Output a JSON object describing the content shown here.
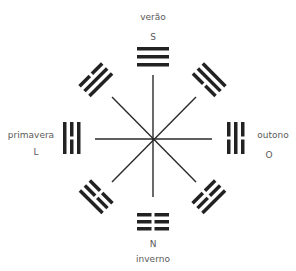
{
  "diagram": {
    "type": "bagua-compass",
    "center": {
      "x": 153,
      "y": 139
    },
    "line_color": "#2a2a2a",
    "trigram_color": "#222222",
    "seasons": {
      "top": {
        "season": "verão",
        "direction": "S",
        "trigram": "qian",
        "lines_outer_to_inner": [
          "solid",
          "solid",
          "solid"
        ]
      },
      "bottom": {
        "season": "inverno",
        "direction": "N",
        "trigram": "kun",
        "lines_outer_to_inner": [
          "broken",
          "broken",
          "broken"
        ]
      },
      "left": {
        "season": "primavera",
        "direction": "L",
        "trigram": "li",
        "lines_outer_to_inner": [
          "solid",
          "broken",
          "solid"
        ]
      },
      "right": {
        "season": "outono",
        "direction": "O",
        "trigram": "kan",
        "lines_outer_to_inner": [
          "broken",
          "solid",
          "broken"
        ]
      }
    },
    "diagonals": {
      "top_left": {
        "trigram": "dui",
        "lines_outer_to_inner": [
          "broken",
          "solid",
          "solid"
        ]
      },
      "top_right": {
        "trigram": "xun",
        "lines_outer_to_inner": [
          "solid",
          "solid",
          "broken"
        ]
      },
      "bottom_left": {
        "trigram": "zhen",
        "lines_outer_to_inner": [
          "solid",
          "broken",
          "broken"
        ]
      },
      "bottom_right": {
        "trigram": "gen",
        "lines_outer_to_inner": [
          "solid",
          "broken",
          "broken"
        ]
      }
    }
  }
}
